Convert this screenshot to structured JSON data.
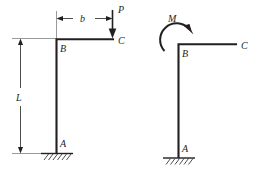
{
  "figure": {
    "background_color": "#ffffff",
    "ink_color": "#231f20",
    "thin_line_color": "#6d6e71",
    "diagrams": [
      {
        "name": "left-frame-with-point-load",
        "description": "L-shaped cantilever frame fixed at base A, corner B, free end C, with downward point load P at C",
        "labels": {
          "support_point": "A",
          "corner_point": "B",
          "free_end_point": "C",
          "load": "P",
          "horizontal_dimension": "b",
          "vertical_dimension": "L"
        },
        "load_direction": "down",
        "support_type": "fixed"
      },
      {
        "name": "right-frame-with-moment",
        "description": "L-shaped cantilever frame fixed at base A, corner B, free end C, with clockwise applied moment M at B",
        "labels": {
          "support_point": "A",
          "corner_point": "B",
          "free_end_point": "C",
          "moment": "M"
        },
        "moment_direction": "clockwise",
        "support_type": "fixed"
      }
    ]
  }
}
